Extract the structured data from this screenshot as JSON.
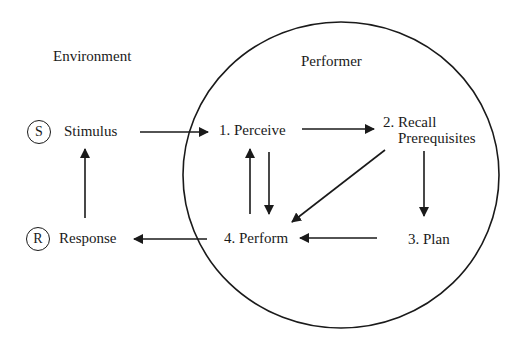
{
  "diagram": {
    "regions": {
      "environment": {
        "label": "Environment"
      },
      "performer": {
        "label": "Performer"
      }
    },
    "environment_nodes": {
      "stimulus": {
        "badge": "S",
        "label": "Stimulus"
      },
      "response": {
        "badge": "R",
        "label": "Response"
      }
    },
    "performer_nodes": {
      "perceive": {
        "label": "1. Perceive"
      },
      "recall": {
        "label_line1": "2. Recall",
        "label_line2": "Prerequisites"
      },
      "plan": {
        "label": "3. Plan"
      },
      "perform": {
        "label": "4. Perform"
      }
    },
    "edges": [
      {
        "from": "Stimulus",
        "to": "1. Perceive"
      },
      {
        "from": "1. Perceive",
        "to": "2. Recall Prerequisites"
      },
      {
        "from": "2. Recall Prerequisites",
        "to": "3. Plan"
      },
      {
        "from": "2. Recall Prerequisites",
        "to": "4. Perform"
      },
      {
        "from": "3. Plan",
        "to": "4. Perform"
      },
      {
        "from": "1. Perceive",
        "to": "4. Perform"
      },
      {
        "from": "4. Perform",
        "to": "1. Perceive"
      },
      {
        "from": "4. Perform",
        "to": "Response"
      },
      {
        "from": "Response",
        "to": "Stimulus"
      }
    ],
    "colors": {
      "ink": "#1a1a1a",
      "background": "#ffffff"
    }
  }
}
